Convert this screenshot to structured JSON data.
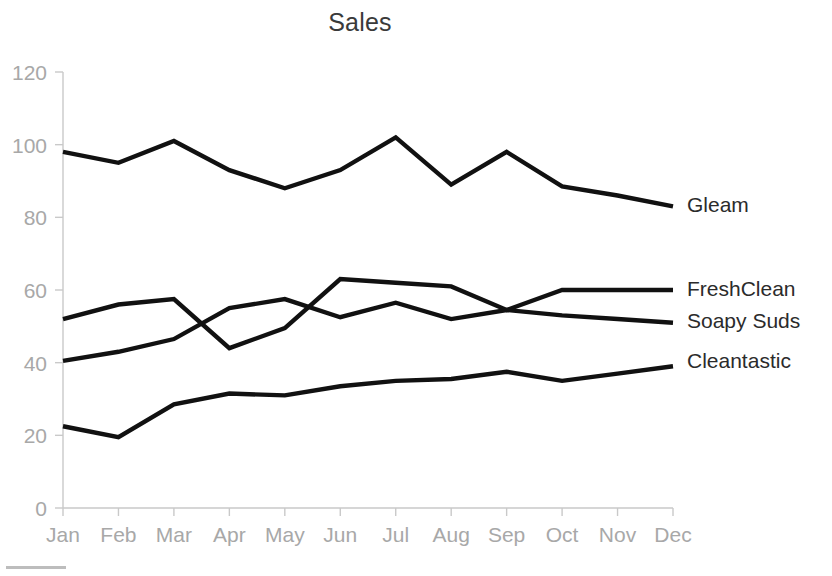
{
  "chart_data": {
    "type": "line",
    "title": "Sales",
    "xlabel": "",
    "ylabel": "",
    "categories": [
      "Jan",
      "Feb",
      "Mar",
      "Apr",
      "May",
      "Jun",
      "Jul",
      "Aug",
      "Sep",
      "Oct",
      "Nov",
      "Dec"
    ],
    "ylim": [
      0,
      120
    ],
    "yticks": [
      0,
      20,
      40,
      60,
      80,
      100,
      120
    ],
    "grid": false,
    "legend_position": "right-inline-end-of-line",
    "series": [
      {
        "name": "Gleam",
        "color": "#111111",
        "values": [
          98,
          95,
          101,
          93,
          88,
          93,
          102,
          89,
          98,
          88.5,
          86,
          83
        ]
      },
      {
        "name": "FreshClean",
        "color": "#111111",
        "values": [
          52,
          56,
          57.5,
          44,
          49.5,
          63,
          62,
          61,
          54.5,
          60,
          60,
          60
        ]
      },
      {
        "name": "Soapy Suds",
        "color": "#111111",
        "values": [
          40.5,
          43,
          46.5,
          55,
          57.5,
          52.5,
          56.5,
          52,
          54.5,
          53,
          52,
          51
        ]
      },
      {
        "name": "Cleantastic",
        "color": "#111111",
        "values": [
          22.5,
          19.5,
          28.5,
          31.5,
          31,
          33.5,
          35,
          35.5,
          37.5,
          35,
          37,
          39
        ]
      }
    ]
  },
  "axis": {
    "y_tick_labels": [
      "0",
      "20",
      "40",
      "60",
      "80",
      "100",
      "120"
    ],
    "x_tick_labels": [
      "Jan",
      "Feb",
      "Mar",
      "Apr",
      "May",
      "Jun",
      "Jul",
      "Aug",
      "Sep",
      "Oct",
      "Nov",
      "Dec"
    ],
    "tick_color": "#c9c9c9",
    "label_color": "#a8a8a8"
  },
  "series_labels": [
    {
      "name": "Gleam",
      "y_value": 83
    },
    {
      "name": "FreshClean",
      "y_value": 60
    },
    {
      "name": "Soapy Suds",
      "y_value": 51
    },
    {
      "name": "Cleantastic",
      "y_value": 40
    }
  ]
}
